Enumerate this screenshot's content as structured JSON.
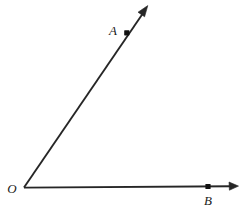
{
  "figure": {
    "background_color": "#ffffff",
    "stroke_color": "#262626",
    "label_color": "#1a1a1a",
    "width": 242,
    "height": 209
  },
  "labels": {
    "vertex": "O",
    "point_a": "A",
    "point_b": "B"
  },
  "geometry": {
    "vertex": {
      "x": 24,
      "y": 187.5
    },
    "ray_a": {
      "name": "ray-OA",
      "from": {
        "x": 24,
        "y": 187.5
      },
      "to": {
        "x": 147.5,
        "y": 6.5
      },
      "angle_degrees": 55.6,
      "arrow_tip": {
        "x": 147.5,
        "y": 6.5
      }
    },
    "ray_b": {
      "name": "ray-OB",
      "from": {
        "x": 24,
        "y": 187.5
      },
      "to": {
        "x": 238,
        "y": 186
      },
      "angle_degrees": 0.4,
      "arrow_tip": {
        "x": 238,
        "y": 186
      }
    },
    "point_a_dot": {
      "x": 127,
      "y": 33
    },
    "point_b_dot": {
      "x": 208,
      "y": 186.5
    },
    "label_a_pos": {
      "x": 118,
      "y": 31
    },
    "label_b_pos": {
      "x": 208,
      "y": 203
    },
    "label_o_pos": {
      "x": 13,
      "y": 191
    }
  }
}
